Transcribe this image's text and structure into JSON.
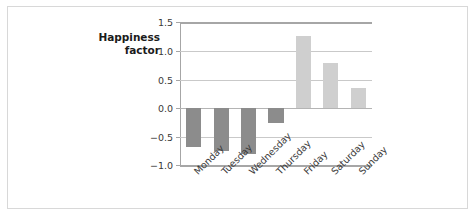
{
  "figure": {
    "axis_label_line1": "Happiness",
    "axis_label_line2": "factor",
    "axis_label": "Happiness\nfactor",
    "bar_color_negative": "#8c8c8c",
    "bar_color_positive": "#cfcfcf",
    "gridline_color": "#c9c9c9",
    "spine_color": "#a6a6a6",
    "frame_color": "#d8d8d8",
    "background": "#ffffff"
  },
  "chart_data": {
    "type": "bar",
    "title": "",
    "xlabel": "",
    "ylabel": "Happiness factor",
    "categories": [
      "Monday",
      "Tuesday",
      "Wednesday",
      "Thursday",
      "Friday",
      "Saturday",
      "Sunday"
    ],
    "values": [
      -0.67,
      -0.74,
      -0.8,
      -0.26,
      1.25,
      0.78,
      0.35
    ],
    "ylim": [
      -1.0,
      1.5
    ],
    "yticks": [
      1.5,
      1.0,
      0.5,
      0.0,
      -0.5,
      -1.0
    ],
    "ytick_labels": [
      "1.5",
      "1.0",
      "0.5",
      "0.0",
      "-0.5",
      "-1.0"
    ],
    "grid": true,
    "legend": false,
    "xtick_rotation": -45,
    "bar_width_fraction": 0.55
  }
}
